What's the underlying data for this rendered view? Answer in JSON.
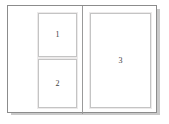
{
  "document": {
    "title": "Layout Preview",
    "background_color": "#ffffff",
    "card": {
      "background_color": "#ffffff",
      "border_color": "#8c8c8c",
      "shadow_color": "#c9c9c9"
    },
    "divider": {
      "name": "vertical-divider",
      "color": "#9a9a9a",
      "orientation": "vertical"
    }
  },
  "panes": [
    {
      "name": "left-pane",
      "frames": [
        {
          "id": 1,
          "label": "1",
          "border_color": "#c4c4c4",
          "fill_color": "#ffffff"
        },
        {
          "id": 2,
          "label": "2",
          "border_color": "#c4c4c4",
          "fill_color": "#ffffff"
        }
      ]
    },
    {
      "name": "right-pane",
      "frames": [
        {
          "id": 3,
          "label": "3",
          "border_color": "#c4c4c4",
          "fill_color": "#ffffff"
        }
      ]
    }
  ]
}
